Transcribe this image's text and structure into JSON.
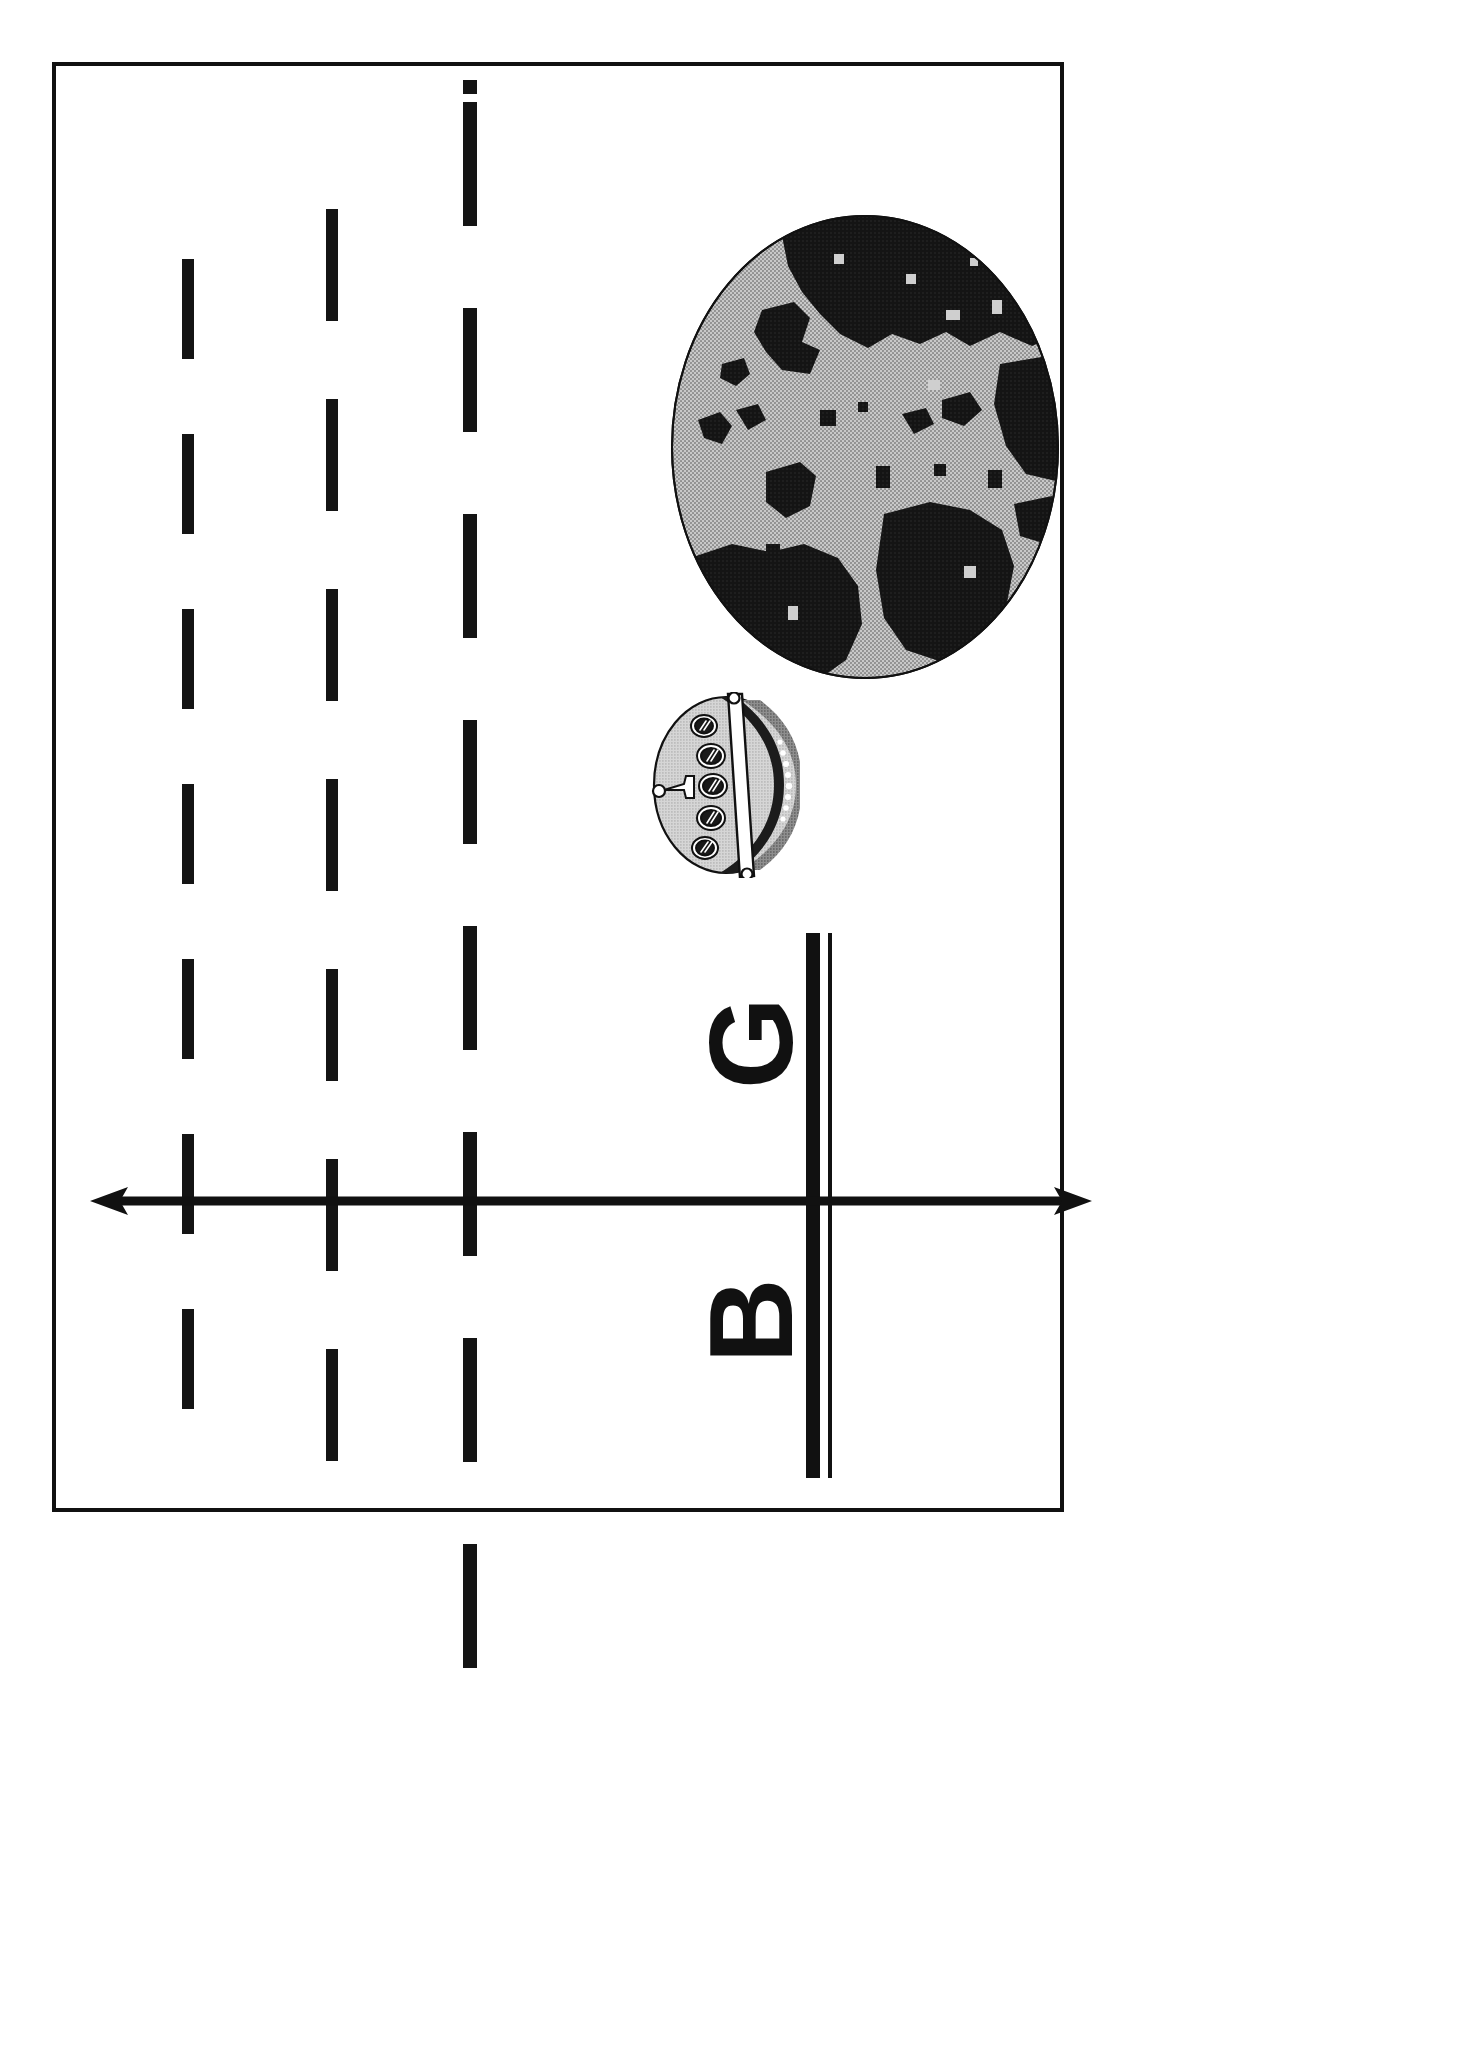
{
  "document": {
    "kind": "scanned-figure-page",
    "orientation": "rotated-90-ccw",
    "background_color": "#ffffff",
    "ink_color": "#111111",
    "border": {
      "color": "#111111",
      "width_px": 4
    }
  },
  "figure": {
    "title": "",
    "caption": "",
    "elements": [
      {
        "name": "globe",
        "label": "Earth globe with halftone continents"
      },
      {
        "name": "ship",
        "label": "Ship hull with five portholes and mast"
      },
      {
        "name": "axis",
        "label": "Vertical double rule crossed by horizontal double-headed arrow"
      }
    ]
  },
  "labels": {
    "g": "G",
    "b": "B"
  },
  "dashed_lines": [
    {
      "name": "dashed-line-outer",
      "x": 178,
      "top": 255,
      "dash_px": 100,
      "gap_px": 75,
      "count": 7,
      "width_px": 12,
      "has_top_square": false
    },
    {
      "name": "dashed-line-middle",
      "x": 322,
      "top": 205,
      "dash_px": 112,
      "gap_px": 78,
      "count": 7,
      "width_px": 12,
      "has_top_square": false
    },
    {
      "name": "dashed-line-inner",
      "x": 459,
      "top": 98,
      "dash_px": 124,
      "gap_px": 82,
      "count": 8,
      "width_px": 14,
      "has_top_square": true
    }
  ],
  "globe": {
    "name": "globe",
    "cx": 195,
    "cy": 233,
    "rx": 195,
    "ry": 233,
    "ocean_color": "#b4b4b4",
    "land_color": "#151515",
    "outline_color": "#111111"
  },
  "ship": {
    "name": "ship",
    "hull_fill": "#cfcfcf",
    "shadow_fill": "#5a5a5a",
    "deck_fill": "#1a1a1a",
    "outline_color": "#111111",
    "porthole_count": 5,
    "dot_count": 8,
    "mast_label": "mast"
  },
  "axis": {
    "name": "coordinate-axis",
    "vertical_rule_color": "#111111",
    "arrow_color": "#111111",
    "arrow_heads": "both",
    "arrow_label": "horizontal-double-arrow"
  }
}
